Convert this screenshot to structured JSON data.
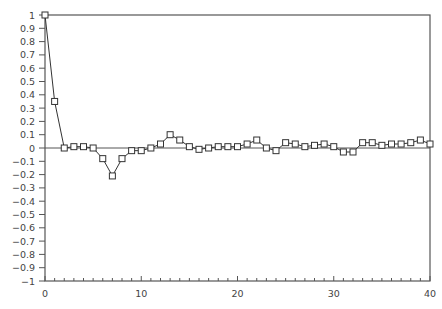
{
  "chart_data": {
    "type": "line",
    "title": "",
    "xlabel": "",
    "ylabel": "",
    "xlim": [
      0,
      40
    ],
    "ylim": [
      -1,
      1
    ],
    "grid": false,
    "legend": null,
    "marker": "open-square",
    "x_ticks": [
      0,
      10,
      20,
      30,
      40
    ],
    "y_ticks": [
      1,
      0.9,
      0.8,
      0.7,
      0.6,
      0.5,
      0.4,
      0.3,
      0.2,
      0.1,
      0,
      -0.1,
      -0.2,
      -0.3,
      -0.4,
      -0.5,
      -0.6,
      -0.7,
      -0.8,
      -0.9,
      -1
    ],
    "y_tick_labels": [
      "1",
      "0.9",
      "0.8",
      "0.7",
      "0.6",
      "0.5",
      "0.4",
      "0.3",
      "0.2",
      "0.1",
      "0",
      "−0.1",
      "−0.2",
      "−0.3",
      "−0.4",
      "−0.5",
      "−0.6",
      "−0.7",
      "−0.8",
      "−0.9",
      "−1"
    ],
    "x_tick_labels": [
      "0",
      "10",
      "20",
      "30",
      "40"
    ],
    "reference_line": 0,
    "x": [
      0,
      1,
      2,
      3,
      4,
      5,
      6,
      7,
      8,
      9,
      10,
      11,
      12,
      13,
      14,
      15,
      16,
      17,
      18,
      19,
      20,
      21,
      22,
      23,
      24,
      25,
      26,
      27,
      28,
      29,
      30,
      31,
      32,
      33,
      34,
      35,
      36,
      37,
      38,
      39,
      40
    ],
    "series": [
      {
        "name": "autocorrelation",
        "values": [
          1.0,
          0.35,
          0.0,
          0.01,
          0.01,
          0.0,
          -0.08,
          -0.21,
          -0.08,
          -0.02,
          -0.02,
          0.0,
          0.03,
          0.1,
          0.06,
          0.01,
          -0.01,
          0.0,
          0.01,
          0.01,
          0.01,
          0.03,
          0.06,
          0.0,
          -0.02,
          0.04,
          0.03,
          0.01,
          0.02,
          0.03,
          0.01,
          -0.03,
          -0.03,
          0.04,
          0.04,
          0.02,
          0.03,
          0.03,
          0.04,
          0.06,
          0.03
        ]
      }
    ],
    "colors": {
      "line": "#333333",
      "frame": "#555555",
      "text": "#444444"
    }
  }
}
